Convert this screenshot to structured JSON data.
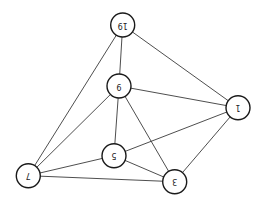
{
  "diagram": {
    "type": "undirected-graph",
    "node_radius": 12,
    "colors": {
      "edge": "#3a3a3a",
      "node_stroke": "#1a1a1a",
      "node_fill": "#ffffff",
      "label": "#222222",
      "background": "#ffffff"
    },
    "label_rotation_deg": 180,
    "nodes": [
      {
        "id": "19",
        "label": "19",
        "x": 122.7,
        "y": 25.0
      },
      {
        "id": "9",
        "label": "9",
        "x": 119.0,
        "y": 86.0
      },
      {
        "id": "1",
        "label": "1",
        "x": 238.0,
        "y": 107.7
      },
      {
        "id": "5",
        "label": "5",
        "x": 114.0,
        "y": 155.7
      },
      {
        "id": "3",
        "label": "3",
        "x": 174.7,
        "y": 181.7
      },
      {
        "id": "7",
        "label": "7",
        "x": 28.3,
        "y": 175.7
      }
    ],
    "edges": [
      {
        "from": "19",
        "to": "9"
      },
      {
        "from": "19",
        "to": "1"
      },
      {
        "from": "19",
        "to": "7"
      },
      {
        "from": "9",
        "to": "1"
      },
      {
        "from": "9",
        "to": "5"
      },
      {
        "from": "9",
        "to": "3"
      },
      {
        "from": "9",
        "to": "7"
      },
      {
        "from": "1",
        "to": "5"
      },
      {
        "from": "1",
        "to": "3"
      },
      {
        "from": "5",
        "to": "7"
      },
      {
        "from": "5",
        "to": "3"
      },
      {
        "from": "7",
        "to": "3"
      }
    ]
  }
}
